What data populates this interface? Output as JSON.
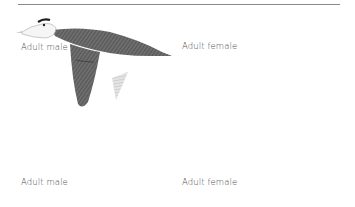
{
  "figure": {
    "panels": [
      {
        "position": "top-left",
        "label": "Adult male",
        "pose": "wings-down",
        "sex": "male"
      },
      {
        "position": "top-right",
        "label": "Adult female",
        "pose": "wings-down",
        "sex": "female"
      },
      {
        "position": "bottom-left",
        "label": "Adult male",
        "pose": "wings-up",
        "sex": "male"
      },
      {
        "position": "bottom-right",
        "label": "Adult female",
        "pose": "wings-up",
        "sex": "female"
      }
    ],
    "colors": {
      "rule": "#8a8a8a",
      "ink_dark": "#3a3a3a",
      "ink_mid": "#7a7a7a",
      "wing_light": "#d8d8d8",
      "background": "#ffffff"
    }
  }
}
